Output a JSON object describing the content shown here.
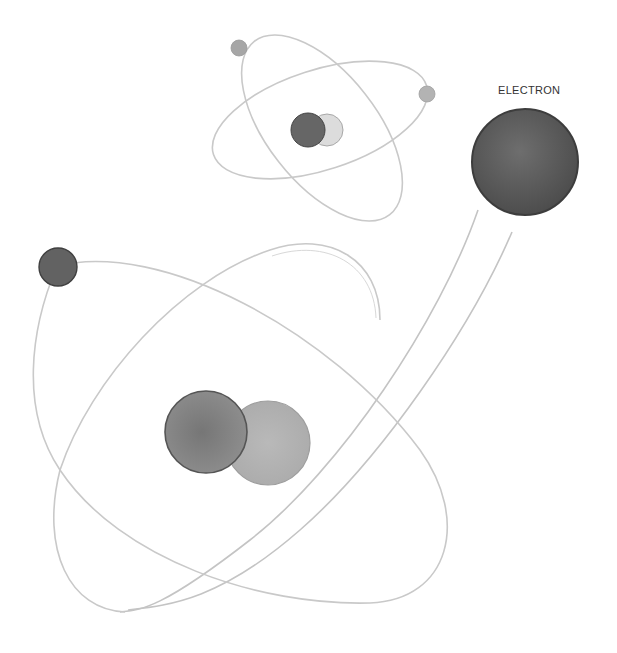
{
  "labels": {
    "electron": "ELECTRON"
  },
  "colors": {
    "background": "#ffffff",
    "orbit": "#c9c9c9",
    "electron_large": "#5e5e5e",
    "proton": "#7d7d7d",
    "neutron": "#b5b5b5",
    "small_electron": "#a8a8a8",
    "small_proton": "#6a6a6a",
    "small_neutron": "#d4d4d4"
  },
  "elements": {
    "small_atom": {
      "nucleus_a": {
        "cx": 308,
        "cy": 130,
        "r": 17
      },
      "nucleus_b": {
        "cx": 327,
        "cy": 131,
        "r": 17
      }
    },
    "large_atom": {
      "nucleus_a": {
        "cx": 206,
        "cy": 432,
        "r": 41
      },
      "nucleus_b": {
        "cx": 268,
        "cy": 443,
        "r": 42
      }
    },
    "featured_electron": {
      "cx": 525,
      "cy": 162,
      "r": 53
    }
  }
}
